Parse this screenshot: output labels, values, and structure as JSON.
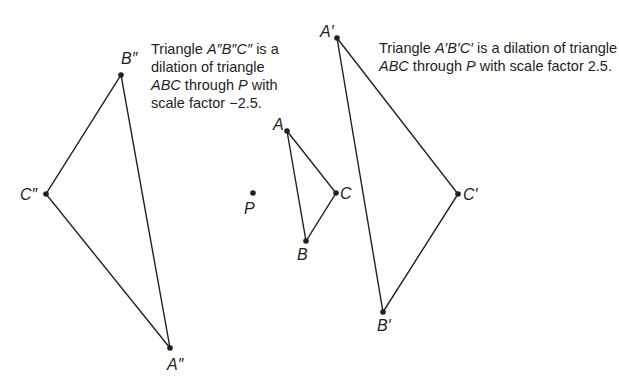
{
  "diagram": {
    "type": "geometry-dilation",
    "line_color": "#231f20",
    "center": {
      "label": "P",
      "x": 253,
      "y": 193
    },
    "triangles": [
      {
        "name": "ABC",
        "points": [
          {
            "label": "A",
            "x": 287,
            "y": 131
          },
          {
            "label": "B",
            "x": 306,
            "y": 241
          },
          {
            "label": "C",
            "x": 336,
            "y": 193
          }
        ]
      },
      {
        "name": "A'B'C'",
        "scale_factor": 2.5,
        "points": [
          {
            "label": "A′",
            "x": 337,
            "y": 38
          },
          {
            "label": "B′",
            "x": 383,
            "y": 312
          },
          {
            "label": "C′",
            "x": 458,
            "y": 194
          }
        ]
      },
      {
        "name": "A''B''C''",
        "scale_factor": -2.5,
        "points": [
          {
            "label": "A″",
            "x": 170,
            "y": 348
          },
          {
            "label": "B″",
            "x": 121,
            "y": 75
          },
          {
            "label": "C″",
            "x": 46,
            "y": 194
          }
        ]
      }
    ]
  },
  "captions": {
    "left": {
      "line1_pre": "Triangle ",
      "line1_name": "A″B″C″",
      "line1_post": " is a",
      "line2": "dilation of triangle",
      "line3_name": "ABC",
      "line3_mid": " through ",
      "line3_p": "P",
      "line3_post": " with",
      "line4": "scale factor −2.5."
    },
    "right": {
      "line1_pre": "Triangle ",
      "line1_name": "A′B′C′",
      "line1_post": " is a dilation of triangle",
      "line2_name": "ABC",
      "line2_mid": " through ",
      "line2_p": "P",
      "line2_post": " with scale factor 2.5."
    }
  },
  "labels": {
    "A": "A",
    "B": "B",
    "C": "C",
    "P": "P",
    "A1": "A′",
    "B1": "B′",
    "C1": "C′",
    "A2": "A″",
    "B2": "B″",
    "C2": "C″"
  }
}
